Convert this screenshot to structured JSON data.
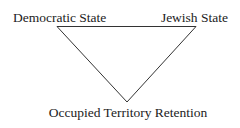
{
  "diagram": {
    "type": "trilemma-triangle",
    "orientation": "inverted",
    "line_color": "#333333",
    "text_color": "#222222",
    "vertices": {
      "top_left": {
        "label": "Democratic State"
      },
      "top_right": {
        "label": "Jewish State"
      },
      "bottom": {
        "label": "Occupied Territory Retention"
      }
    }
  }
}
